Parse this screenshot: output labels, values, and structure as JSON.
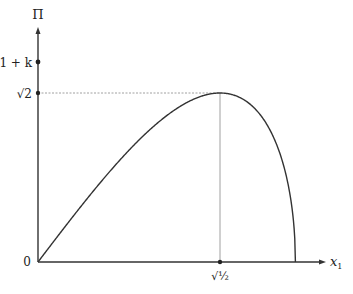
{
  "chart_data": {
    "type": "line",
    "title": "",
    "xlabel": "x₁",
    "ylabel": "Π",
    "function": "Π = 2√2 · x₁ · √(1 − x₁²)",
    "x": [
      0,
      0.1,
      0.2,
      0.3,
      0.4,
      0.5,
      0.6,
      0.7071,
      0.8,
      0.9,
      0.95,
      0.99,
      1.0
    ],
    "series": [
      {
        "name": "Π(x₁)",
        "values": [
          0,
          0.281,
          0.554,
          0.809,
          1.037,
          1.225,
          1.358,
          1.414,
          1.358,
          1.109,
          0.839,
          0.395,
          0
        ]
      }
    ],
    "xlim": [
      0,
      1.1
    ],
    "ylim": [
      0,
      1.95
    ],
    "x_ticks": [
      {
        "value": 0,
        "label": "0"
      },
      {
        "value": 0.7071,
        "label": "√½"
      }
    ],
    "y_ticks": [
      {
        "value": 1.414,
        "label": "√2"
      },
      {
        "value": 1.5,
        "label": "1 + k"
      }
    ],
    "annotations": [
      {
        "type": "dashed-hline",
        "y": 1.414,
        "from_x": 0,
        "to_x": 0.7071
      },
      {
        "type": "vline",
        "x": 0.7071,
        "from_y": 0,
        "to_y": 1.414
      }
    ],
    "grid": false,
    "legend": null
  },
  "labels": {
    "y_axis": "Π",
    "x_axis_main": "x",
    "x_axis_sub": "1",
    "origin": "0",
    "tick_sqrt2": "√2",
    "tick_1k": "1 + k",
    "tick_sqrthalf": "√½"
  }
}
